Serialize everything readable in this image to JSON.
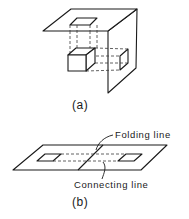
{
  "figure_a": {
    "caption": "(a)",
    "description": "Cube projected onto a horizontal plane and a vertical plane that meet at a fold"
  },
  "figure_b": {
    "caption": "(b)",
    "description": "The two planes unfolded flat",
    "labels": {
      "folding_line": "Folding line",
      "connecting_line": "Connecting line"
    }
  },
  "colors": {
    "line": "#1a1a1a",
    "background": "#ffffff"
  }
}
